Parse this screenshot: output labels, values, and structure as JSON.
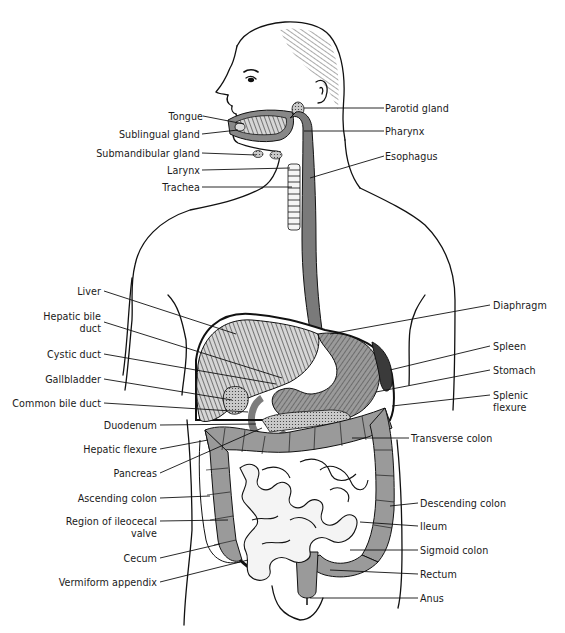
{
  "diagram": {
    "colors": {
      "line": "#111111",
      "organ_fill": "#8e8e8e",
      "organ_light": "#bdbdbd",
      "organ_dark": "#555555",
      "background": "#ffffff",
      "intestine_fill": "#f4f4f4"
    },
    "labels_left": [
      {
        "id": "tongue",
        "text": "Tongue",
        "x": 165,
        "y": 111
      },
      {
        "id": "sublingual-gland",
        "text": "Sublingual gland",
        "x": 200,
        "y": 129
      },
      {
        "id": "submandibular-gland",
        "text": "Submandibular gland",
        "x": 200,
        "y": 148
      },
      {
        "id": "larynx",
        "text": "Larynx",
        "x": 200,
        "y": 165
      },
      {
        "id": "trachea",
        "text": "Trachea",
        "x": 200,
        "y": 182
      },
      {
        "id": "liver",
        "text": "Liver",
        "x": 101,
        "y": 286
      },
      {
        "id": "hepatic-bile-duct",
        "text": "Hepatic bile\nduct",
        "x": 101,
        "y": 311
      },
      {
        "id": "cystic-duct",
        "text": "Cystic duct",
        "x": 101,
        "y": 349
      },
      {
        "id": "gallbladder",
        "text": "Gallbladder",
        "x": 101,
        "y": 374
      },
      {
        "id": "common-bile-duct",
        "text": "Common bile duct",
        "x": 101,
        "y": 398
      },
      {
        "id": "duodenum",
        "text": "Duodenum",
        "x": 157,
        "y": 420
      },
      {
        "id": "hepatic-flexure",
        "text": "Hepatic flexure",
        "x": 157,
        "y": 444
      },
      {
        "id": "pancreas",
        "text": "Pancreas",
        "x": 157,
        "y": 468
      },
      {
        "id": "ascending-colon",
        "text": "Ascending colon",
        "x": 157,
        "y": 493
      },
      {
        "id": "region-of-ileocecal-valve",
        "text": "Region of ileocecal\nvalve",
        "x": 157,
        "y": 516
      },
      {
        "id": "cecum",
        "text": "Cecum",
        "x": 157,
        "y": 553
      },
      {
        "id": "vermiform-appendix",
        "text": "Vermiform appendix",
        "x": 157,
        "y": 577
      }
    ],
    "labels_right": [
      {
        "id": "parotid-gland",
        "text": "Parotid gland",
        "x": 385,
        "y": 103
      },
      {
        "id": "pharynx",
        "text": "Pharynx",
        "x": 385,
        "y": 126
      },
      {
        "id": "esophagus",
        "text": "Esophagus",
        "x": 385,
        "y": 151
      },
      {
        "id": "diaphragm",
        "text": "Diaphragm",
        "x": 493,
        "y": 300
      },
      {
        "id": "spleen",
        "text": "Spleen",
        "x": 493,
        "y": 341
      },
      {
        "id": "stomach",
        "text": "Stomach",
        "x": 493,
        "y": 365
      },
      {
        "id": "splenic-flexure",
        "text": "Splenic\nflexure",
        "x": 493,
        "y": 390
      },
      {
        "id": "transverse-colon",
        "text": "Transverse colon",
        "x": 411,
        "y": 433
      },
      {
        "id": "descending-colon",
        "text": "Descending colon",
        "x": 419,
        "y": 498
      },
      {
        "id": "ileum",
        "text": "Ileum",
        "x": 419,
        "y": 521
      },
      {
        "id": "sigmoid-colon",
        "text": "Sigmoid colon",
        "x": 419,
        "y": 545
      },
      {
        "id": "rectum",
        "text": "Rectum",
        "x": 419,
        "y": 569
      },
      {
        "id": "anus",
        "text": "Anus",
        "x": 419,
        "y": 593
      }
    ]
  }
}
